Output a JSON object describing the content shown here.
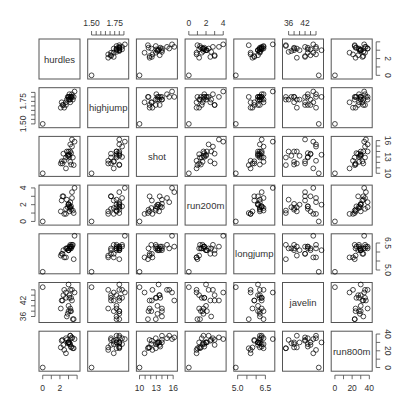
{
  "chart_data": {
    "type": "scatter",
    "title": "",
    "subtype": "scatterplot-matrix",
    "variables": [
      "hurdles",
      "highjump",
      "shot",
      "run200m",
      "longjump",
      "javelin",
      "run800m"
    ],
    "ranges": {
      "hurdles": [
        -0.2,
        4.1
      ],
      "highjump": [
        1.48,
        1.88
      ],
      "shot": [
        9.8,
        16.4
      ],
      "run200m": [
        -0.2,
        4.1
      ],
      "longjump": [
        4.9,
        6.9
      ],
      "javelin": [
        34.5,
        48
      ],
      "run800m": [
        -2,
        41
      ]
    },
    "axes": {
      "top": [
        {
          "col": 1,
          "ticks": [
            1.5,
            1.75
          ],
          "labels": [
            "1.50",
            "1.75"
          ],
          "minor": [
            1.55,
            1.6,
            1.65,
            1.7,
            1.8,
            1.85
          ]
        },
        {
          "col": 3,
          "ticks": [
            0,
            2,
            4
          ],
          "labels": [
            "0",
            "2",
            "4"
          ],
          "minor": [
            1,
            3
          ]
        },
        {
          "col": 5,
          "ticks": [
            36,
            42
          ],
          "labels": [
            "36",
            "42"
          ],
          "minor": [
            38,
            40,
            44,
            46
          ]
        }
      ],
      "bottom": [
        {
          "col": 0,
          "ticks": [
            0,
            2
          ],
          "labels": [
            "0",
            "2"
          ],
          "minor": [
            1,
            3,
            4
          ]
        },
        {
          "col": 2,
          "ticks": [
            10,
            13,
            16
          ],
          "labels": [
            "10",
            "13",
            "16"
          ],
          "minor": [
            11,
            12,
            14,
            15
          ]
        },
        {
          "col": 4,
          "ticks": [
            5.0,
            6.5
          ],
          "labels": [
            "5.0",
            "6.5"
          ],
          "minor": [
            5.5,
            6.0
          ]
        },
        {
          "col": 6,
          "ticks": [
            0,
            20,
            40
          ],
          "labels": [
            "0",
            "20",
            "40"
          ],
          "minor": [
            10,
            30
          ]
        }
      ],
      "left": [
        {
          "row": 1,
          "ticks": [
            1.5,
            1.75
          ],
          "labels": [
            "1.50",
            "1.75"
          ],
          "minor": [
            1.55,
            1.6,
            1.65,
            1.7,
            1.8,
            1.85
          ]
        },
        {
          "row": 3,
          "ticks": [
            0,
            2,
            4
          ],
          "labels": [
            "0",
            "2",
            "4"
          ],
          "minor": [
            1,
            3
          ]
        },
        {
          "row": 5,
          "ticks": [
            36,
            42
          ],
          "labels": [
            "36",
            "42"
          ],
          "minor": [
            38,
            40,
            44,
            46
          ]
        }
      ],
      "right": [
        {
          "row": 0,
          "ticks": [
            0,
            2
          ],
          "labels": [
            "0",
            "2"
          ],
          "minor": [
            1,
            3,
            4
          ]
        },
        {
          "row": 2,
          "ticks": [
            10,
            13,
            16
          ],
          "labels": [
            "10",
            "13",
            "16"
          ],
          "minor": [
            11,
            12,
            14,
            15
          ]
        },
        {
          "row": 4,
          "ticks": [
            5.0,
            6.5
          ],
          "labels": [
            "5.0",
            "6.5"
          ],
          "minor": [
            5.5,
            6.0
          ]
        },
        {
          "row": 6,
          "ticks": [
            0,
            20,
            40
          ],
          "labels": [
            "0",
            "20",
            "40"
          ],
          "minor": [
            10,
            30
          ]
        }
      ]
    },
    "observations": {
      "hurdles": [
        3.7,
        3.4,
        3.4,
        3.2,
        3.0,
        3.1,
        3.2,
        3.3,
        3.0,
        2.8,
        2.7,
        3.1,
        2.4,
        2.3,
        2.2,
        3.0,
        3.3,
        3.5,
        2.9,
        3.2,
        2.5,
        2.7,
        3.6,
        2.1,
        0.0
      ],
      "highjump": [
        1.86,
        1.8,
        1.83,
        1.8,
        1.8,
        1.83,
        1.77,
        1.8,
        1.8,
        1.77,
        1.71,
        1.77,
        1.71,
        1.71,
        1.74,
        1.77,
        1.8,
        1.77,
        1.8,
        1.74,
        1.68,
        1.74,
        1.8,
        1.68,
        1.5
      ],
      "shot": [
        15.8,
        16.2,
        14.9,
        15.3,
        14.0,
        13.0,
        14.0,
        13.7,
        13.4,
        14.0,
        12.9,
        13.5,
        13.6,
        11.8,
        12.2,
        13.2,
        11.6,
        12.9,
        13.2,
        12.1,
        12.3,
        10.9,
        11.5,
        11.8,
        10.0
      ],
      "run200m": [
        4.0,
        3.5,
        2.8,
        2.3,
        2.1,
        1.8,
        1.7,
        1.8,
        2.0,
        2.6,
        1.5,
        1.2,
        3.0,
        3.0,
        2.5,
        2.0,
        1.4,
        1.3,
        1.7,
        1.6,
        0.9,
        0.9,
        1.0,
        1.2,
        0.0
      ],
      "longjump": [
        6.9,
        6.3,
        6.4,
        6.2,
        6.1,
        6.3,
        6.3,
        6.3,
        6.1,
        6.2,
        6.2,
        6.2,
        6.1,
        5.9,
        5.9,
        6.1,
        6.2,
        6.4,
        6.2,
        6.4,
        5.7,
        5.7,
        5.6,
        5.8,
        4.9
      ],
      "javelin": [
        45,
        42,
        46,
        46,
        38,
        43,
        39,
        43,
        48,
        36,
        43,
        44,
        44,
        42,
        42,
        40,
        38,
        35,
        37,
        38,
        46,
        45,
        35,
        39,
        47
      ],
      "run800m": [
        34,
        36,
        35,
        38,
        30,
        28,
        38,
        25,
        30,
        33,
        35,
        30,
        27,
        33,
        32,
        30,
        24,
        23,
        29,
        28,
        21,
        17,
        23,
        24,
        0
      ]
    },
    "diagonal_labels": [
      "hurdles",
      "highjump",
      "shot",
      "run200m",
      "longjump",
      "javelin",
      "run800m"
    ],
    "marker": "open circle",
    "colors": {
      "points": "#000000",
      "frame": "#555555",
      "text": "#333333"
    }
  }
}
